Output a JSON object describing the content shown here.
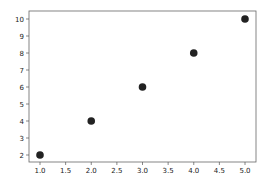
{
  "chart_data": {
    "type": "scatter",
    "title": "",
    "xlabel": "",
    "ylabel": "",
    "x": [
      1.0,
      2.0,
      3.0,
      4.0,
      5.0
    ],
    "y": [
      2,
      4,
      6,
      8,
      10
    ],
    "series": [
      {
        "name": "",
        "x": [
          1.0,
          2.0,
          3.0,
          4.0,
          5.0
        ],
        "y": [
          2,
          4,
          6,
          8,
          10
        ],
        "color": "#222222"
      }
    ],
    "xlim": [
      0.8,
      5.2
    ],
    "ylim": [
      1.6,
      10.4
    ],
    "xticks": [
      "1.0",
      "1.5",
      "2.0",
      "2.5",
      "3.0",
      "3.5",
      "4.0",
      "4.5",
      "5.0"
    ],
    "yticks": [
      "2",
      "3",
      "4",
      "5",
      "6",
      "7",
      "8",
      "9",
      "10"
    ],
    "grid": false,
    "legend": null
  },
  "colors": {
    "marker": "#222222",
    "axis": "#555555",
    "text": "#222222"
  }
}
